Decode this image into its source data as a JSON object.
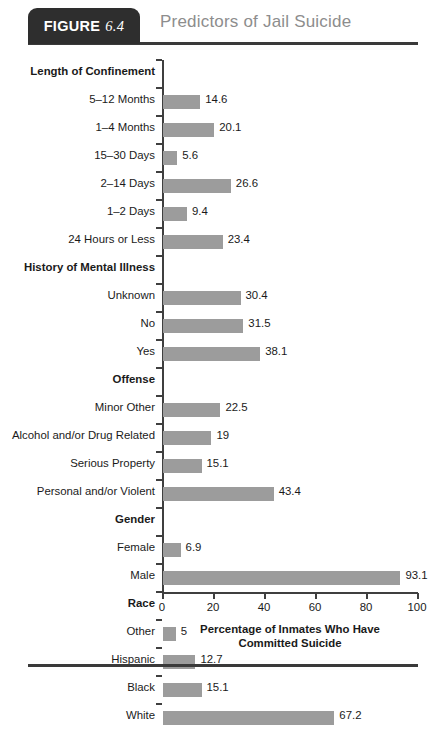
{
  "header": {
    "tag_word": "FIGURE",
    "tag_number": "6.4",
    "title": "Predictors of Jail Suicide"
  },
  "chart_data": {
    "type": "bar",
    "orientation": "horizontal",
    "title": "Predictors of Jail Suicide",
    "xlabel": "Percentage of Inmates Who Have Committed Suicide",
    "xlabel_line1": "Percentage of Inmates Who Have",
    "xlabel_line2": "Committed Suicide",
    "ylabel": "",
    "xlim": [
      0,
      100
    ],
    "xticks": [
      0,
      20,
      40,
      60,
      80,
      100
    ],
    "xtick_labels": [
      "0",
      "20",
      "40",
      "60",
      "80",
      "100"
    ],
    "grid": false,
    "legend": false,
    "bar_color": "#9c9c9c",
    "axis_color": "#3f3f3f",
    "rows": [
      {
        "label": "Length of Confinement",
        "group": true,
        "value": null
      },
      {
        "label": "5–12 Months",
        "group": false,
        "value": 14.6
      },
      {
        "label": "1–4 Months",
        "group": false,
        "value": 20.1
      },
      {
        "label": "15–30 Days",
        "group": false,
        "value": 5.6
      },
      {
        "label": "2–14 Days",
        "group": false,
        "value": 26.6
      },
      {
        "label": "1–2 Days",
        "group": false,
        "value": 9.4
      },
      {
        "label": "24 Hours or Less",
        "group": false,
        "value": 23.4
      },
      {
        "label": "History of Mental Illness",
        "group": true,
        "value": null
      },
      {
        "label": "Unknown",
        "group": false,
        "value": 30.4
      },
      {
        "label": "No",
        "group": false,
        "value": 31.5
      },
      {
        "label": "Yes",
        "group": false,
        "value": 38.1
      },
      {
        "label": "Offense",
        "group": true,
        "value": null
      },
      {
        "label": "Minor Other",
        "group": false,
        "value": 22.5
      },
      {
        "label": "Alcohol and/or Drug Related",
        "group": false,
        "value": 19
      },
      {
        "label": "Serious Property",
        "group": false,
        "value": 15.1
      },
      {
        "label": "Personal and/or Violent",
        "group": false,
        "value": 43.4
      },
      {
        "label": "Gender",
        "group": true,
        "value": null
      },
      {
        "label": "Female",
        "group": false,
        "value": 6.9
      },
      {
        "label": "Male",
        "group": false,
        "value": 93.1
      },
      {
        "label": "Race",
        "group": true,
        "value": null
      },
      {
        "label": "Other",
        "group": false,
        "value": 5
      },
      {
        "label": "Hispanic",
        "group": false,
        "value": 12.7
      },
      {
        "label": "Black",
        "group": false,
        "value": 15.1
      },
      {
        "label": "White",
        "group": false,
        "value": 67.2
      }
    ]
  }
}
